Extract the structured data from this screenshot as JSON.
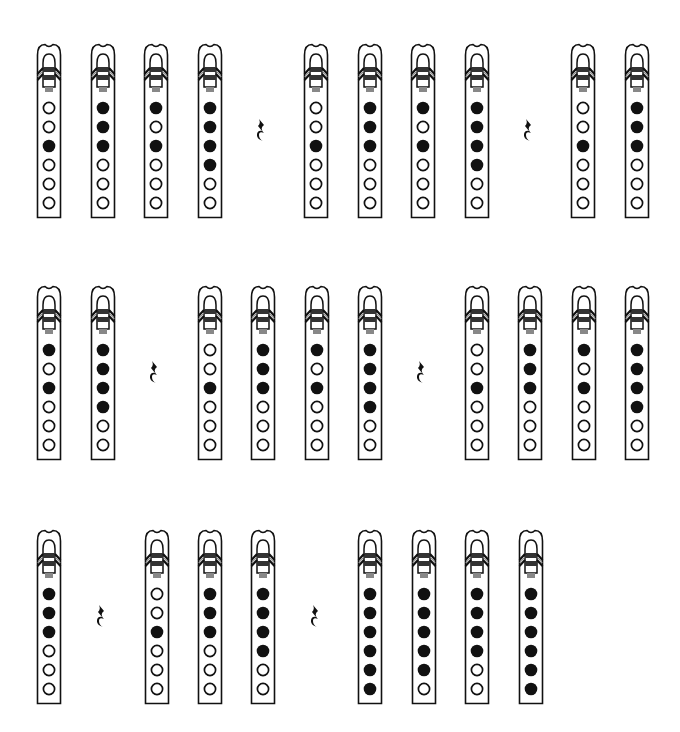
{
  "colors": {
    "ink": "#111111",
    "plug": "#888888",
    "paper": "#ffffff"
  },
  "legend": {
    "filled": "covered hole",
    "open": "open hole"
  },
  "rows": [
    {
      "top": 43,
      "items": [
        {
          "type": "flute",
          "x": 36,
          "holes": [
            0,
            0,
            1,
            0,
            0,
            0
          ]
        },
        {
          "type": "flute",
          "x": 90,
          "holes": [
            1,
            1,
            1,
            0,
            0,
            0
          ]
        },
        {
          "type": "flute",
          "x": 143,
          "holes": [
            1,
            0,
            1,
            0,
            0,
            0
          ]
        },
        {
          "type": "flute",
          "x": 197,
          "holes": [
            1,
            1,
            1,
            1,
            0,
            0
          ]
        },
        {
          "type": "rest",
          "x": 255,
          "symbol": "quarter-rest"
        },
        {
          "type": "flute",
          "x": 303,
          "holes": [
            0,
            0,
            1,
            0,
            0,
            0
          ]
        },
        {
          "type": "flute",
          "x": 357,
          "holes": [
            1,
            1,
            1,
            0,
            0,
            0
          ]
        },
        {
          "type": "flute",
          "x": 410,
          "holes": [
            1,
            0,
            1,
            0,
            0,
            0
          ]
        },
        {
          "type": "flute",
          "x": 464,
          "holes": [
            1,
            1,
            1,
            1,
            0,
            0
          ]
        },
        {
          "type": "rest",
          "x": 522,
          "symbol": "quarter-rest"
        },
        {
          "type": "flute",
          "x": 570,
          "holes": [
            0,
            0,
            1,
            0,
            0,
            0
          ]
        },
        {
          "type": "flute",
          "x": 624,
          "holes": [
            1,
            1,
            1,
            0,
            0,
            0
          ]
        }
      ]
    },
    {
      "top": 285,
      "items": [
        {
          "type": "flute",
          "x": 36,
          "holes": [
            1,
            0,
            1,
            0,
            0,
            0
          ]
        },
        {
          "type": "flute",
          "x": 90,
          "holes": [
            1,
            1,
            1,
            1,
            0,
            0
          ]
        },
        {
          "type": "rest",
          "x": 148,
          "symbol": "quarter-rest"
        },
        {
          "type": "flute",
          "x": 197,
          "holes": [
            0,
            0,
            1,
            0,
            0,
            0
          ]
        },
        {
          "type": "flute",
          "x": 250,
          "holes": [
            1,
            1,
            1,
            0,
            0,
            0
          ]
        },
        {
          "type": "flute",
          "x": 304,
          "holes": [
            1,
            0,
            1,
            0,
            0,
            0
          ]
        },
        {
          "type": "flute",
          "x": 357,
          "holes": [
            1,
            1,
            1,
            1,
            0,
            0
          ]
        },
        {
          "type": "rest",
          "x": 415,
          "symbol": "quarter-rest"
        },
        {
          "type": "flute",
          "x": 464,
          "holes": [
            0,
            0,
            1,
            0,
            0,
            0
          ]
        },
        {
          "type": "flute",
          "x": 517,
          "holes": [
            1,
            1,
            1,
            0,
            0,
            0
          ]
        },
        {
          "type": "flute",
          "x": 571,
          "holes": [
            1,
            0,
            1,
            0,
            0,
            0
          ]
        },
        {
          "type": "flute",
          "x": 624,
          "holes": [
            1,
            1,
            1,
            1,
            0,
            0
          ]
        }
      ]
    },
    {
      "top": 529,
      "items": [
        {
          "type": "flute",
          "x": 36,
          "holes": [
            1,
            1,
            1,
            0,
            0,
            0
          ]
        },
        {
          "type": "rest",
          "x": 95,
          "symbol": "quarter-rest"
        },
        {
          "type": "flute",
          "x": 144,
          "holes": [
            0,
            0,
            1,
            0,
            0,
            0
          ]
        },
        {
          "type": "flute",
          "x": 197,
          "holes": [
            1,
            1,
            1,
            0,
            0,
            0
          ]
        },
        {
          "type": "flute",
          "x": 250,
          "holes": [
            1,
            1,
            1,
            1,
            0,
            0
          ]
        },
        {
          "type": "rest",
          "x": 309,
          "symbol": "quarter-rest"
        },
        {
          "type": "flute",
          "x": 357,
          "holes": [
            1,
            1,
            1,
            1,
            1,
            1
          ]
        },
        {
          "type": "flute",
          "x": 411,
          "holes": [
            1,
            1,
            1,
            1,
            1,
            0
          ]
        },
        {
          "type": "flute",
          "x": 464,
          "holes": [
            1,
            1,
            1,
            1,
            0,
            0
          ]
        },
        {
          "type": "flute",
          "x": 518,
          "holes": [
            1,
            1,
            1,
            1,
            1,
            1
          ]
        }
      ]
    }
  ]
}
